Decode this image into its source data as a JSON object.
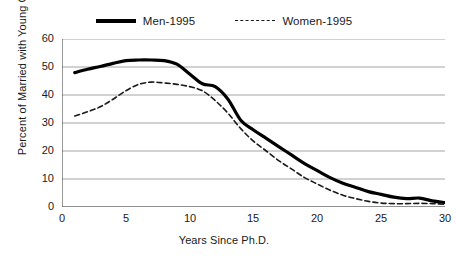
{
  "legend": {
    "position": "top-center",
    "entries": [
      {
        "label": "Men-1995",
        "style": "solid",
        "color": "#000000",
        "icon": "solid-line-icon"
      },
      {
        "label": "Women-1995",
        "style": "dashed",
        "color": "#1a1a1a",
        "icon": "dashed-line-icon"
      }
    ]
  },
  "axes": {
    "x_title": "Years Since Ph.D.",
    "y_title": "Percent of Married with Young Children",
    "x_ticks": [
      "0",
      "5",
      "10",
      "15",
      "20",
      "25",
      "30"
    ],
    "y_ticks": [
      "60",
      "50",
      "40",
      "30",
      "20",
      "10",
      "0"
    ]
  },
  "chart_data": {
    "type": "line",
    "title": "",
    "subtitle": "",
    "xlabel": "Years Since Ph.D.",
    "ylabel": "Percent of Married with Young Children",
    "xlim": [
      0,
      30
    ],
    "ylim": [
      0,
      60
    ],
    "xticks": [
      0,
      5,
      10,
      15,
      20,
      25,
      30
    ],
    "yticks": [
      0,
      10,
      20,
      30,
      40,
      50,
      60
    ],
    "grid": "horizontal",
    "legend_position": "top-center",
    "x": [
      1,
      2,
      3,
      4,
      5,
      6,
      7,
      8,
      9,
      10,
      11,
      12,
      13,
      14,
      15,
      16,
      17,
      18,
      19,
      20,
      21,
      22,
      23,
      24,
      25,
      26,
      27,
      28,
      29,
      30
    ],
    "series": [
      {
        "name": "Men-1995",
        "style": "solid",
        "color": "#000000",
        "linewidth": 3.2,
        "values": [
          48.0,
          49.2,
          50.2,
          51.3,
          52.3,
          52.5,
          52.5,
          52.3,
          51.0,
          47.5,
          44.0,
          43.0,
          38.5,
          31.0,
          27.5,
          24.5,
          21.5,
          18.5,
          15.5,
          13.0,
          10.5,
          8.5,
          7.0,
          5.5,
          4.5,
          3.5,
          3.0,
          3.2,
          2.2,
          1.6
        ]
      },
      {
        "name": "Women-1995",
        "style": "dashed",
        "color": "#1a1a1a",
        "linewidth": 1.6,
        "values": [
          32.5,
          34.0,
          35.8,
          38.5,
          41.5,
          43.8,
          44.6,
          44.3,
          43.8,
          43.0,
          41.5,
          38.0,
          33.5,
          28.0,
          23.5,
          20.0,
          16.5,
          13.5,
          10.5,
          8.2,
          6.0,
          4.2,
          3.0,
          2.0,
          1.4,
          1.2,
          1.2,
          1.3,
          1.2,
          1.0
        ]
      }
    ]
  }
}
